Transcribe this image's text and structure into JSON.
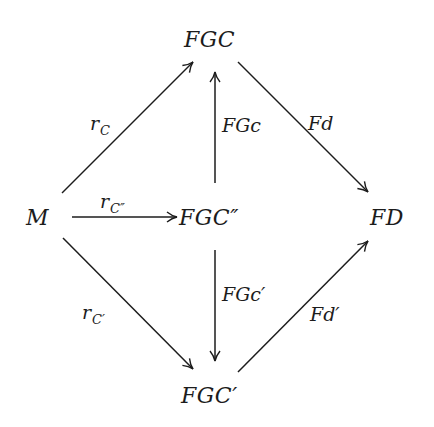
{
  "diagram": {
    "type": "commutative-diagram",
    "nodes": {
      "top": "FGC",
      "left": "M",
      "center": "FGC″",
      "right": "FD",
      "bottom": "FGC′"
    },
    "arrows": {
      "left_to_top": {
        "label_main": "r",
        "label_sub": "C",
        "from": "M",
        "to": "FGC"
      },
      "left_to_center": {
        "label_main": "r",
        "label_sub": "C″",
        "from": "M",
        "to": "FGC″"
      },
      "left_to_bottom": {
        "label_main": "r",
        "label_sub": "C′",
        "from": "M",
        "to": "FGC′"
      },
      "center_to_top": {
        "label": "FGc",
        "from": "FGC″",
        "to": "FGC"
      },
      "center_to_bottom": {
        "label": "FGc′",
        "from": "FGC″",
        "to": "FGC′"
      },
      "top_to_right": {
        "label": "Fd",
        "from": "FGC",
        "to": "FD"
      },
      "bottom_to_right": {
        "label": "Fd′",
        "from": "FGC′",
        "to": "FD"
      }
    },
    "colors": {
      "ink": "#1c1c1c",
      "background": "#ffffff"
    }
  }
}
